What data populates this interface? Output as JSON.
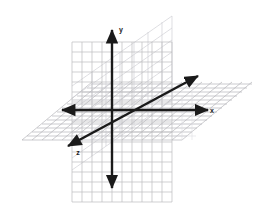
{
  "figure": {
    "background_color": "#ffffff",
    "width": 274,
    "height": 224
  },
  "colors": {
    "axis": "#1a1a1a",
    "grid_vertical_plane": "#b9b9bd",
    "grid_vertical_plane_back": "#cfcfd4",
    "grid_horizontal_plane": "#b4b4b8",
    "grid_faint": "#dcdce0",
    "label": "#1a1a1a"
  },
  "origin": {
    "x": 112,
    "y": 110,
    "label": "O"
  },
  "axes": [
    {
      "id": "x",
      "label": "x",
      "label_x": 212,
      "label_y": 112,
      "direction": "horizontal",
      "start_x": 62,
      "start_y": 110,
      "end_x": 208,
      "end_y": 110,
      "arrow_start": true,
      "arrow_end": true
    },
    {
      "id": "y",
      "label": "y",
      "label_x": 140,
      "label_y": 34,
      "direction": "vertical",
      "start_x": 112,
      "start_y": 30,
      "end_x": 112,
      "end_y": 188,
      "arrow_start": true,
      "arrow_end": true
    },
    {
      "id": "z",
      "label": "z",
      "label_x": 78,
      "label_y": 153,
      "direction": "diagonal",
      "start_x": 68,
      "start_y": 146,
      "end_x": 198,
      "end_y": 76,
      "arrow_start": true,
      "arrow_end": true
    }
  ],
  "planes": [
    {
      "id": "xy-plane",
      "name": "vertical grid plane",
      "orientation": "vertical",
      "grid_spacing": 10,
      "columns": 10,
      "rows": 16,
      "left": 72,
      "top": 42,
      "right": 172,
      "bottom": 202
    },
    {
      "id": "xz-plane",
      "name": "horizontal grid plane",
      "orientation": "horizontal",
      "grid_spacing": 10,
      "columns": 14,
      "rows": 7,
      "left": 22,
      "top": 80,
      "right": 252,
      "bottom": 140
    }
  ],
  "grid": {
    "show": true,
    "style": "square cells with oblique depth lines"
  }
}
